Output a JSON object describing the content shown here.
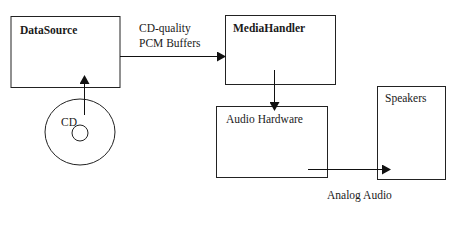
{
  "diagram": {
    "nodes": [
      {
        "id": "datasource",
        "label": "DataSource",
        "bold": true
      },
      {
        "id": "mediahandler",
        "label": "MediaHandler",
        "bold": true
      },
      {
        "id": "audiohardware",
        "label": "Audio Hardware",
        "bold": false
      },
      {
        "id": "speakers",
        "label": "Speakers",
        "bold": false
      },
      {
        "id": "cd",
        "label": "CD",
        "shape": "disc"
      }
    ],
    "edges": [
      {
        "from": "cd",
        "to": "datasource",
        "label": ""
      },
      {
        "from": "datasource",
        "to": "mediahandler",
        "label_line1": "CD-quality",
        "label_line2": "PCM Buffers"
      },
      {
        "from": "mediahandler",
        "to": "audiohardware",
        "label": ""
      },
      {
        "from": "audiohardware",
        "to": "speakers",
        "label": "Analog Audio"
      }
    ],
    "colors": {
      "stroke": "#1a1a1a",
      "background": "#ffffff"
    }
  }
}
